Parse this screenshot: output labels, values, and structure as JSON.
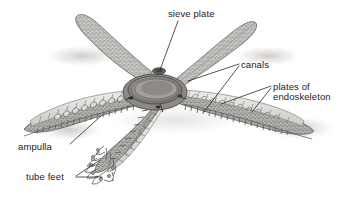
{
  "figure": {
    "style": "grayscale pencil / stipple scientific illustration",
    "background_color": "#ffffff",
    "ink_color": "#1c1c1c",
    "body_fill": "#e7e6e4",
    "body_shade": "#b9b7b4",
    "arm_count": 5
  },
  "labels": [
    {
      "id": "sieve-plate",
      "text": "sieve plate",
      "x": 168,
      "y": 9,
      "align": "left"
    },
    {
      "id": "canals",
      "text": "canals",
      "x": 241,
      "y": 60,
      "align": "left"
    },
    {
      "id": "plates-line1",
      "text": "plates of",
      "x": 273,
      "y": 82,
      "align": "left"
    },
    {
      "id": "plates-line2",
      "text": "endoskeleton",
      "x": 273,
      "y": 92,
      "align": "left"
    },
    {
      "id": "ampulla",
      "text": "ampulla",
      "x": 18,
      "y": 142,
      "align": "left"
    },
    {
      "id": "tube-feet",
      "text": "tube feet",
      "x": 26,
      "y": 172,
      "align": "left"
    }
  ],
  "leaders": [
    {
      "id": "leader-sieve-plate",
      "points": "178,21 160,70"
    },
    {
      "id": "leader-canals-a",
      "points": "239,64 188,81"
    },
    {
      "id": "leader-canals-b",
      "points": "239,66 204,112"
    },
    {
      "id": "leader-plates-a",
      "points": "271,86 221,104"
    },
    {
      "id": "leader-plates-b",
      "points": "271,88 252,112"
    },
    {
      "id": "leader-ampulla",
      "points": "70,144 101,116"
    },
    {
      "id": "leader-tube-feet-a",
      "points": "76,176 100,162"
    },
    {
      "id": "leader-tube-feet-b",
      "points": "76,178 102,176"
    }
  ],
  "anatomy_parts": [
    {
      "name": "sieve plate (madreporite)",
      "location": "top of central disc"
    },
    {
      "name": "ring canal and radial canals",
      "location": "central disc and arm interiors"
    },
    {
      "name": "plates of endoskeleton",
      "location": "right arm wall"
    },
    {
      "name": "ampulla",
      "location": "left arm interior, paired bulbs"
    },
    {
      "name": "tube feet",
      "location": "lower arm tip, underside"
    },
    {
      "name": "central disc",
      "location": "center"
    }
  ]
}
